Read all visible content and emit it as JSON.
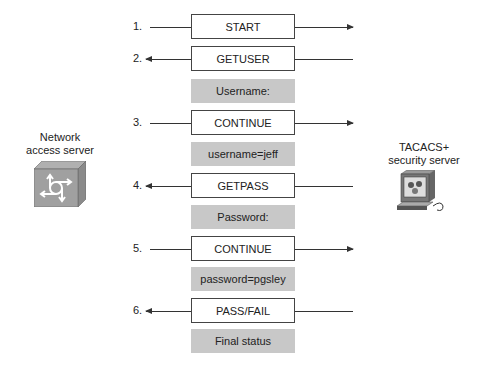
{
  "nodes": {
    "nas": {
      "label_line1": "Network",
      "label_line2": "access server",
      "icon": "router-cube-icon"
    },
    "tacacs": {
      "label_line1": "TACACS+",
      "label_line2": "security server",
      "icon": "workstation-icon"
    }
  },
  "steps": [
    {
      "num": "1.",
      "message": "START",
      "direction": "right",
      "data": ""
    },
    {
      "num": "2.",
      "message": "GETUSER",
      "direction": "left",
      "data": "Username:"
    },
    {
      "num": "3.",
      "message": "CONTINUE",
      "direction": "right",
      "data": "username=jeff"
    },
    {
      "num": "4.",
      "message": "GETPASS",
      "direction": "left",
      "data": "Password:"
    },
    {
      "num": "5.",
      "message": "CONTINUE",
      "direction": "right",
      "data": "password=pgsley"
    },
    {
      "num": "6.",
      "message": "PASS/FAIL",
      "direction": "left",
      "data": "Final status"
    }
  ],
  "colors": {
    "data_box": "#c8c8c8",
    "line": "#333333"
  }
}
